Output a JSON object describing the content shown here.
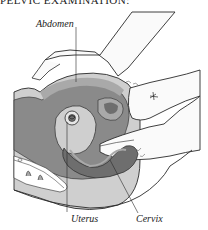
{
  "heading": "PELVIC EXAMINATION:",
  "figure": {
    "labels": {
      "abdomen": "Abdomen",
      "uterus": "Uterus",
      "cervix": "Cervix"
    },
    "colors": {
      "background": "#ffffff",
      "outline": "#2a2a2a",
      "body_dark": "#8a8a8a",
      "body_mid": "#a9a9a9",
      "body_light": "#cfcfcf",
      "hand_fill": "#fafafa",
      "organ_dark": "#6e6e6e"
    }
  }
}
